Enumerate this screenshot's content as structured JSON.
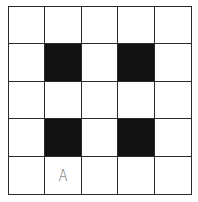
{
  "grid": {
    "rows": 5,
    "cols": 5,
    "fill_color": "#111111",
    "empty_color": "#ffffff",
    "line_color": "#2a2a2a",
    "cells": [
      [
        {
          "filled": false,
          "label": ""
        },
        {
          "filled": false,
          "label": ""
        },
        {
          "filled": false,
          "label": ""
        },
        {
          "filled": false,
          "label": ""
        },
        {
          "filled": false,
          "label": ""
        }
      ],
      [
        {
          "filled": false,
          "label": ""
        },
        {
          "filled": true,
          "label": ""
        },
        {
          "filled": false,
          "label": ""
        },
        {
          "filled": true,
          "label": ""
        },
        {
          "filled": false,
          "label": ""
        }
      ],
      [
        {
          "filled": false,
          "label": ""
        },
        {
          "filled": false,
          "label": ""
        },
        {
          "filled": false,
          "label": ""
        },
        {
          "filled": false,
          "label": ""
        },
        {
          "filled": false,
          "label": ""
        }
      ],
      [
        {
          "filled": false,
          "label": ""
        },
        {
          "filled": true,
          "label": ""
        },
        {
          "filled": false,
          "label": ""
        },
        {
          "filled": true,
          "label": ""
        },
        {
          "filled": false,
          "label": ""
        }
      ],
      [
        {
          "filled": false,
          "label": ""
        },
        {
          "filled": false,
          "label": "A"
        },
        {
          "filled": false,
          "label": ""
        },
        {
          "filled": false,
          "label": ""
        },
        {
          "filled": false,
          "label": ""
        }
      ]
    ]
  }
}
